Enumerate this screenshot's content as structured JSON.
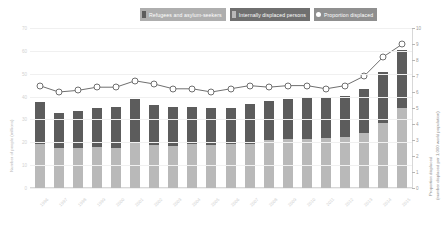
{
  "legend": {
    "items": [
      {
        "label": "Refugees and asylum-seekers",
        "color": "#5c5c5c",
        "bg": "#aeaeae",
        "swatch": "#5c5c5c"
      },
      {
        "label": "Internally displaced persons",
        "color": "#ffffff",
        "bg": "#6f6f6f",
        "swatch": "#b9b9b9"
      },
      {
        "label": "Proportion displaced",
        "color": "#ffffff",
        "bg": "#8f8f8f",
        "swatch": "#ffffff"
      }
    ]
  },
  "axes": {
    "left_title": "Number of people (millions)",
    "right_title_line1": "Proportion displaced",
    "right_title_line2": "(number displaced per 1,000 world population)",
    "left_ticks": [
      "70",
      "60",
      "50",
      "40",
      "30",
      "20",
      "10",
      "0"
    ],
    "right_ticks": [
      "10",
      "9",
      "8",
      "7",
      "6",
      "5",
      "4",
      "3",
      "2",
      "1",
      "0"
    ]
  },
  "chart_data": {
    "type": "bar",
    "title": "",
    "xlabel": "",
    "ylabel": "Number of people (millions)",
    "y2label": "Proportion displaced (number displaced per 1,000 world population)",
    "ylim": [
      0,
      70
    ],
    "y2lim": [
      0,
      10
    ],
    "grid": true,
    "legend_position": "top",
    "categories": [
      "1996",
      "1997",
      "1998",
      "1999",
      "2000",
      "2001",
      "2002",
      "2003",
      "2004",
      "2005",
      "2006",
      "2007",
      "2008",
      "2009",
      "2010",
      "2011",
      "2012",
      "2013",
      "2014",
      "2015"
    ],
    "series": [
      {
        "name": "Internally displaced persons",
        "type": "bar",
        "stack": "total",
        "color": "#b9b9b9",
        "axis": "left",
        "values": [
          19.3,
          17.4,
          17.4,
          17.8,
          17.6,
          19.8,
          18.9,
          18.6,
          19.2,
          19.0,
          19.2,
          19.3,
          21.0,
          21.4,
          21.6,
          21.7,
          22.2,
          23.9,
          28.5,
          35.0
        ]
      },
      {
        "name": "Refugees and asylum-seekers",
        "type": "bar",
        "stack": "total",
        "color": "#5c5c5c",
        "axis": "left",
        "values": [
          18.2,
          15.6,
          16.2,
          17.2,
          17.9,
          19.0,
          17.6,
          16.8,
          16.4,
          15.8,
          16.0,
          17.6,
          17.1,
          17.4,
          17.6,
          17.5,
          18.0,
          19.6,
          22.2,
          25.4
        ]
      },
      {
        "name": "Proportion displaced",
        "type": "line",
        "color": "#6f6f6f",
        "marker": "circle",
        "axis": "right",
        "values": [
          6.4,
          6.0,
          6.1,
          6.3,
          6.3,
          6.7,
          6.5,
          6.2,
          6.2,
          6.0,
          6.2,
          6.4,
          6.3,
          6.4,
          6.4,
          6.2,
          6.4,
          7.0,
          8.2,
          9.0
        ]
      }
    ]
  }
}
